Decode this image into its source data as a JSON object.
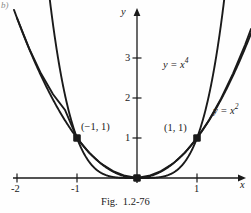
{
  "figure": {
    "corner_tag": "b)",
    "caption_prefix": "Fig.",
    "caption_number": "1.2-76",
    "ink_color": "#1a1a1a",
    "background_color": "#fefefe"
  },
  "axes": {
    "x_axis_name": "x",
    "y_axis_name": "y",
    "x_ticks": [
      "-2",
      "-1",
      "1"
    ],
    "y_ticks": [
      "1",
      "2",
      "3"
    ]
  },
  "curves": {
    "quartic_label_base": "y = x",
    "quartic_label_exp": "4",
    "quadratic_label_base": "y = x",
    "quadratic_label_exp": "2"
  },
  "points": {
    "left_label": "(−1, 1)",
    "right_label": "(1, 1)"
  },
  "chart_data": {
    "type": "line",
    "xlabel": "x",
    "ylabel": "y",
    "xlim": [
      -2.0,
      1.9
    ],
    "ylim": [
      -0.15,
      4.4
    ],
    "xticks": [
      -2,
      -1,
      1
    ],
    "yticks": [
      1,
      2,
      3
    ],
    "grid": false,
    "legend": "inline-curve-labels",
    "series": [
      {
        "name": "y = x^4",
        "equation": "y = x^4",
        "label_position": [
          0.62,
          2.85
        ],
        "x": [
          -1.45,
          -1.4,
          -1.3,
          -1.2,
          -1.1,
          -1.0,
          -0.9,
          -0.8,
          -0.7,
          -0.6,
          -0.5,
          -0.4,
          -0.3,
          -0.2,
          -0.1,
          0.0,
          0.1,
          0.2,
          0.3,
          0.4,
          0.5,
          0.6,
          0.7,
          0.8,
          0.9,
          1.0,
          1.1,
          1.2,
          1.3,
          1.4,
          1.45
        ],
        "y": [
          4.42,
          3.84,
          2.86,
          2.07,
          1.46,
          1.0,
          0.66,
          0.41,
          0.24,
          0.13,
          0.06,
          0.03,
          0.01,
          0.002,
          0.0001,
          0.0,
          0.0001,
          0.002,
          0.01,
          0.03,
          0.06,
          0.13,
          0.24,
          0.41,
          0.66,
          1.0,
          1.46,
          2.07,
          2.86,
          3.84,
          4.42
        ]
      },
      {
        "name": "y = x^2",
        "equation": "y = x^2",
        "label_position": [
          1.42,
          1.95
        ],
        "x": [
          -2.0,
          -1.8,
          -1.6,
          -1.4,
          -1.2,
          -1.0,
          -0.8,
          -0.6,
          -0.4,
          -0.2,
          0.0,
          0.2,
          0.4,
          0.6,
          0.8,
          1.0,
          1.2,
          1.4,
          1.6,
          1.8,
          1.9
        ],
        "y": [
          4.0,
          3.24,
          2.56,
          1.96,
          1.44,
          1.0,
          0.64,
          0.36,
          0.16,
          0.04,
          0.0,
          0.04,
          0.16,
          0.36,
          0.64,
          1.0,
          1.44,
          1.96,
          2.56,
          3.24,
          3.61
        ]
      }
    ],
    "annotations": [
      {
        "text": "(−1, 1)",
        "x": -1,
        "y": 1,
        "marker": "filled-square"
      },
      {
        "text": "(1, 1)",
        "x": 1,
        "y": 1,
        "marker": "filled-square"
      },
      {
        "text": "",
        "x": 0,
        "y": 0,
        "marker": "filled-square"
      }
    ]
  }
}
